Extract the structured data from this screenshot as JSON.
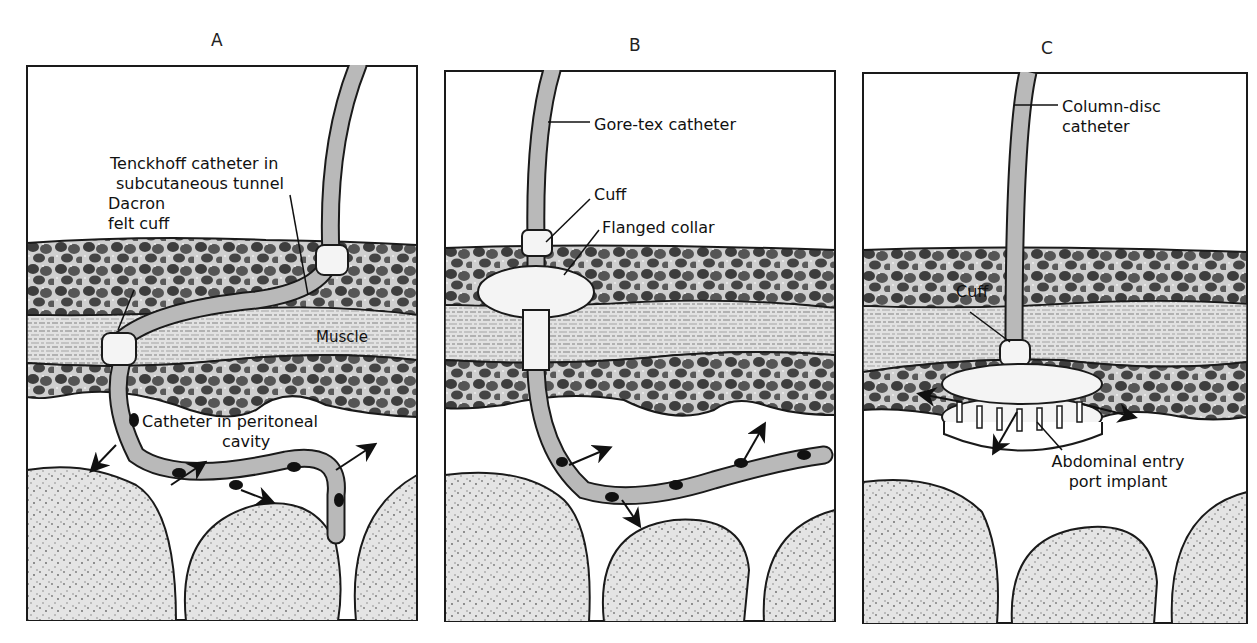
{
  "figure": {
    "panels": [
      {
        "id": "A",
        "letter": "A",
        "labels": {
          "catheter": [
            "Tenckhoff catheter in",
            "subcutaneous tunnel"
          ],
          "cuff": [
            "Dacron",
            "felt cuff"
          ],
          "muscle": "Muscle",
          "cavity": [
            "Catheter in peritoneal",
            "cavity"
          ]
        }
      },
      {
        "id": "B",
        "letter": "B",
        "labels": {
          "catheter": "Gore-tex catheter",
          "cuff": "Cuff",
          "collar": "Flanged collar"
        }
      },
      {
        "id": "C",
        "letter": "C",
        "labels": {
          "catheter": [
            "Column-disc",
            "catheter"
          ],
          "cuff": "Cuff",
          "implant": [
            "Abdominal entry",
            "port implant"
          ]
        }
      }
    ]
  },
  "colors": {
    "outline": "#1a1a1a",
    "catheter_fill": "#b9b9b9",
    "tissue_dark": "#4a4a4a",
    "tissue_light": "#d6d6d6",
    "cuff_fill": "#f4f4f4",
    "background": "#ffffff"
  }
}
